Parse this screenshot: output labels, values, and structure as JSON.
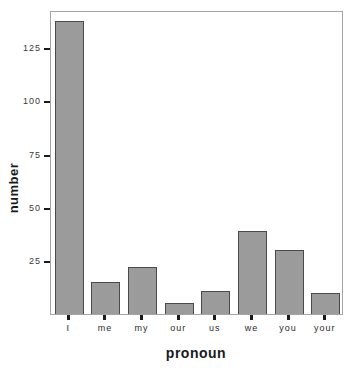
{
  "chart_data": {
    "type": "bar",
    "title": "",
    "xlabel": "pronoun",
    "ylabel": "number",
    "categories": [
      "I",
      "me",
      "my",
      "our",
      "us",
      "we",
      "you",
      "your"
    ],
    "values": [
      138,
      15,
      22,
      5,
      11,
      39,
      30,
      10
    ],
    "ylim": [
      0,
      143
    ],
    "yticks": [
      25,
      50,
      75,
      100,
      125
    ],
    "grid": "off",
    "legend": "none",
    "colors": {
      "bar_fill": "#9b9b9b",
      "bar_border": "#4a4a4a",
      "frame": "#a5a5a5",
      "tick": "#1a1a1a",
      "tick_label": "#3a3a3a",
      "background": "#ffffff"
    }
  },
  "layout": {
    "plot_left": 50,
    "plot_top": 11,
    "plot_width": 293,
    "plot_height": 304,
    "bar_width_fraction": 0.79
  }
}
